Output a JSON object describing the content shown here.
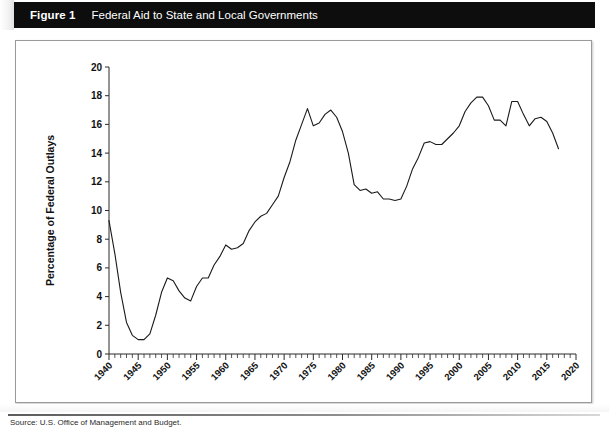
{
  "banner": {
    "figure_number": "Figure 1",
    "title": "Federal Aid to State and Local Governments"
  },
  "source": {
    "note": "Source: U.S. Office of Management and Budget."
  },
  "chart_data": {
    "type": "line",
    "title": "Federal Aid to State and Local Governments",
    "xlabel": "",
    "ylabel": "Percentage of Federal Outlays",
    "xlim": [
      1940,
      2020
    ],
    "ylim": [
      0,
      20
    ],
    "yticks": [
      0,
      2,
      4,
      6,
      8,
      10,
      12,
      14,
      16,
      18,
      20
    ],
    "xticks": [
      1940,
      1945,
      1950,
      1955,
      1960,
      1965,
      1970,
      1975,
      1980,
      1985,
      1990,
      1995,
      2000,
      2005,
      2010,
      2015,
      2020
    ],
    "xtick_minor_step": 1,
    "grid": false,
    "legend": null,
    "line_color": "#1a1a1a",
    "series": [
      {
        "name": "Federal aid as percentage of federal outlays",
        "x": [
          1940,
          1941,
          1942,
          1943,
          1944,
          1945,
          1946,
          1947,
          1948,
          1949,
          1950,
          1951,
          1952,
          1953,
          1954,
          1955,
          1956,
          1957,
          1958,
          1959,
          1960,
          1961,
          1962,
          1963,
          1964,
          1965,
          1966,
          1967,
          1968,
          1969,
          1970,
          1971,
          1972,
          1973,
          1974,
          1975,
          1976,
          1977,
          1978,
          1979,
          1980,
          1981,
          1982,
          1983,
          1984,
          1985,
          1986,
          1987,
          1988,
          1989,
          1990,
          1991,
          1992,
          1993,
          1994,
          1995,
          1996,
          1997,
          1998,
          1999,
          2000,
          2001,
          2002,
          2003,
          2004,
          2005,
          2006,
          2007,
          2008,
          2009,
          2010,
          2011,
          2012,
          2013,
          2014,
          2015,
          2016,
          2017
        ],
        "values": [
          9.3,
          7.0,
          4.3,
          2.2,
          1.3,
          1.0,
          1.0,
          1.4,
          2.7,
          4.3,
          5.3,
          5.1,
          4.4,
          3.9,
          3.7,
          4.7,
          5.3,
          5.3,
          6.2,
          6.8,
          7.6,
          7.3,
          7.4,
          7.7,
          8.6,
          9.2,
          9.6,
          9.8,
          10.4,
          11.0,
          12.3,
          13.4,
          14.9,
          16.0,
          17.1,
          15.9,
          16.1,
          16.7,
          17.0,
          16.5,
          15.5,
          14.0,
          11.8,
          11.4,
          11.5,
          11.2,
          11.3,
          10.8,
          10.8,
          10.7,
          10.8,
          11.7,
          12.9,
          13.7,
          14.7,
          14.8,
          14.6,
          14.6,
          15.0,
          15.4,
          15.9,
          16.9,
          17.5,
          17.9,
          17.9,
          17.3,
          16.3,
          16.3,
          15.9,
          17.6,
          17.6,
          16.7,
          15.9,
          16.4,
          16.5,
          16.2,
          15.4,
          14.3
        ]
      }
    ]
  }
}
